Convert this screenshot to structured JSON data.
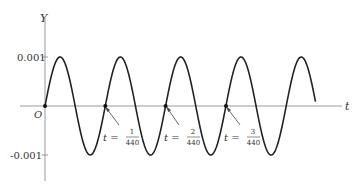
{
  "chart_data": {
    "type": "line",
    "title": "",
    "xlabel": "t",
    "ylabel": "Y",
    "function": "Y = 0.001 sin(2π·440·t)",
    "amplitude": 0.001,
    "frequency_hz": 440,
    "x_range": [
      0,
      0.0102
    ],
    "ylim": [
      -0.0015,
      0.0015
    ],
    "y_ticks": [
      {
        "value": 0.001,
        "label": "0.001"
      },
      {
        "value": -0.001,
        "label": "-0.001"
      }
    ],
    "origin_label": "O",
    "grid": false,
    "legend": null,
    "marked_points": [
      {
        "t": 0,
        "y": 0,
        "label": "O"
      },
      {
        "t": 0.0022727,
        "y": 0,
        "label_prefix": "t =",
        "num": "1",
        "den": "440"
      },
      {
        "t": 0.0045455,
        "y": 0,
        "label_prefix": "t =",
        "num": "2",
        "den": "440"
      },
      {
        "t": 0.0068182,
        "y": 0,
        "label_prefix": "t =",
        "num": "3",
        "den": "440"
      }
    ],
    "series": [
      {
        "name": "Y(t)",
        "description": "sine wave starting at origin going upward, about 4.5 periods shown",
        "x": [
          0,
          0.000568,
          0.001136,
          0.001705,
          0.002273,
          0.002841,
          0.003409,
          0.003977,
          0.004545,
          0.005114,
          0.005682,
          0.00625,
          0.006818,
          0.007386,
          0.007955,
          0.008523,
          0.009091,
          0.009659,
          0.0102
        ],
        "values": [
          0,
          0.001,
          0,
          -0.001,
          0,
          0.001,
          0,
          -0.001,
          0,
          0.001,
          0,
          -0.001,
          0,
          0.001,
          0,
          -0.001,
          0,
          0.001,
          -0.0003
        ]
      }
    ]
  },
  "labels": {
    "y_axis": "Y",
    "t_axis": "t",
    "origin": "O",
    "tick_pos": "0.001",
    "tick_neg": "-0.001",
    "t_eq": "t =",
    "frac1_num": "1",
    "frac1_den": "440",
    "frac2_num": "2",
    "frac2_den": "440",
    "frac3_num": "3",
    "frac3_den": "440"
  }
}
